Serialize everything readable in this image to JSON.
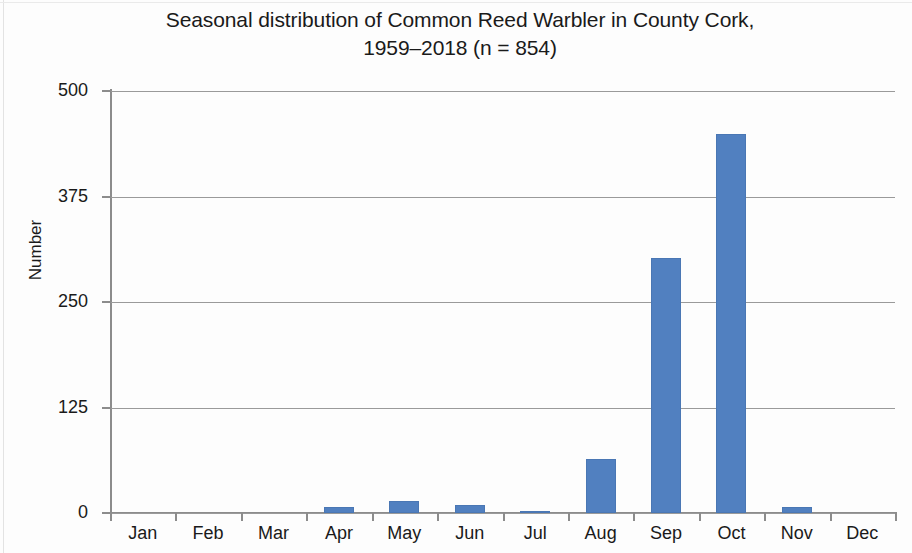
{
  "chart_data": {
    "type": "bar",
    "title": "Seasonal distribution of Common Reed Warbler in County Cork, 1959–2018 (n = 854)",
    "title_line1": "Seasonal distribution of Common Reed Warbler in County Cork,",
    "title_line2": "1959–2018 (n = 854)",
    "xlabel": "",
    "ylabel": "Number",
    "categories": [
      "Jan",
      "Feb",
      "Mar",
      "Apr",
      "May",
      "Jun",
      "Jul",
      "Aug",
      "Sep",
      "Oct",
      "Nov",
      "Dec"
    ],
    "values": [
      0,
      0,
      0,
      7,
      14,
      9,
      2,
      64,
      302,
      449,
      7,
      0
    ],
    "ylim": [
      0,
      500
    ],
    "yticks": [
      0,
      125,
      250,
      375,
      500
    ],
    "ytick_labels": [
      "0",
      "125",
      "250",
      "375",
      "500"
    ],
    "grid": true,
    "legend": false,
    "bar_color": "#5180c0",
    "axis_color": "#8c8c8c",
    "text_color": "#1a1a1a",
    "background": "#ffffff",
    "sample_size": 854,
    "year_range": "1959–2018",
    "species": "Common Reed Warbler",
    "location": "County Cork"
  }
}
